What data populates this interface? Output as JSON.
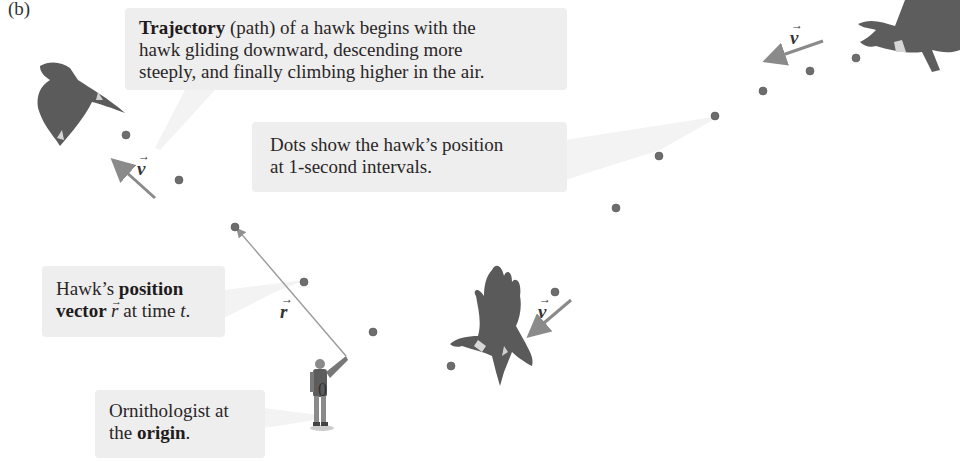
{
  "figure": {
    "panel_label": "(b)",
    "callouts": {
      "trajectory": {
        "bold": "Trajectory",
        "line1_rest": " (path) of a hawk begins with the",
        "line2": "hawk gliding downward, descending more",
        "line3": "steeply, and finally climbing higher in the air."
      },
      "dots": {
        "line1": "Dots show the hawk’s position",
        "line2": "at 1-second intervals."
      },
      "position_vector": {
        "line1_plain": "Hawk’s ",
        "line1_bold": "position",
        "line2_bold": "vector ",
        "line2_symbol": "r",
        "line2_rest": " at time ",
        "line2_t": "t",
        "line2_end": "."
      },
      "origin": {
        "line1": "Ornithologist at",
        "line2_plain": "the ",
        "line2_bold": "origin",
        "line2_end": "."
      }
    },
    "labels": {
      "velocity_symbol": "v",
      "position_symbol": "r",
      "origin": "0"
    },
    "trajectory_dots": [
      [
        126,
        135
      ],
      [
        179,
        180
      ],
      [
        235,
        227
      ],
      [
        304,
        282
      ],
      [
        373,
        332
      ],
      [
        451,
        366
      ],
      [
        555,
        292
      ],
      [
        616,
        208
      ],
      [
        659,
        156
      ],
      [
        715,
        116
      ],
      [
        763,
        91
      ],
      [
        810,
        71
      ],
      [
        856,
        58
      ]
    ],
    "colors": {
      "dot": "#6d6d6d",
      "arrow": "#8a8a8a",
      "callout_bg": "#eeeeee",
      "hawk": "#5a5a5a"
    }
  }
}
